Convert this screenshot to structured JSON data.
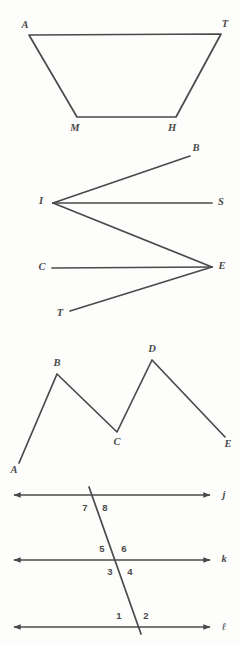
{
  "page": {
    "background_color": "#fdfdfc",
    "ink_color": "#4a4a4a",
    "width": 241,
    "height": 645
  },
  "figures": [
    {
      "id": "figure-1",
      "name": "trapezoid-ATHM",
      "type": "polygon",
      "description": "Closed quadrilateral (trapezoid) with vertices A, T, H, M",
      "vertices": [
        {
          "label": "A",
          "x": 29,
          "y": 35,
          "label_x": 25,
          "label_y": 26
        },
        {
          "label": "T",
          "x": 221,
          "y": 34,
          "label_x": 225,
          "label_y": 25
        },
        {
          "label": "H",
          "x": 176,
          "y": 117,
          "label_x": 172,
          "label_y": 129
        },
        {
          "label": "M",
          "x": 77,
          "y": 117,
          "label_x": 75,
          "label_y": 129
        }
      ],
      "closed": true
    },
    {
      "id": "figure-2",
      "name": "zigzag-BISCET",
      "type": "rays-and-segments",
      "description": "Zigzag: ray IB, ray IS, segment I to E, ray EC, ray ET",
      "points": [
        {
          "label": "B",
          "x": 190,
          "y": 156,
          "label_x": 196,
          "label_y": 149
        },
        {
          "label": "I",
          "x": 53,
          "y": 203,
          "label_x": 41,
          "label_y": 202
        },
        {
          "label": "S",
          "x": 212,
          "y": 203,
          "label_x": 221,
          "label_y": 203
        },
        {
          "label": "C",
          "x": 52,
          "y": 268,
          "label_x": 42,
          "label_y": 268
        },
        {
          "label": "E",
          "x": 212,
          "y": 267,
          "label_x": 222,
          "label_y": 267
        },
        {
          "label": "T",
          "x": 70,
          "y": 311,
          "label_x": 60,
          "label_y": 314
        }
      ],
      "paths": [
        [
          "B",
          "I"
        ],
        [
          "I",
          "S"
        ],
        [
          "I",
          "E"
        ],
        [
          "C",
          "E"
        ],
        [
          "E",
          "T"
        ]
      ]
    },
    {
      "id": "figure-3",
      "name": "polyline-ABCDE",
      "type": "polyline",
      "description": "Open W-shaped polyline through A, B, C, D, E",
      "vertices": [
        {
          "label": "A",
          "x": 19,
          "y": 463,
          "label_x": 14,
          "label_y": 471
        },
        {
          "label": "B",
          "x": 57,
          "y": 374,
          "label_x": 57,
          "label_y": 364
        },
        {
          "label": "C",
          "x": 117,
          "y": 432,
          "label_x": 117,
          "label_y": 443
        },
        {
          "label": "D",
          "x": 152,
          "y": 360,
          "label_x": 152,
          "label_y": 350
        },
        {
          "label": "E",
          "x": 225,
          "y": 437,
          "label_x": 228,
          "label_y": 445
        }
      ],
      "closed": false
    },
    {
      "id": "figure-4",
      "name": "parallel-lines-transversal",
      "type": "parallel-lines",
      "description": "Three parallel lines j, k and script-l cut by one transversal forming eight numbered angles",
      "lines": [
        {
          "label": "j",
          "y": 495,
          "x1": 12,
          "x2": 212,
          "label_x": 224,
          "label_y": 496
        },
        {
          "label": "k",
          "y": 560,
          "x1": 12,
          "x2": 212,
          "label_x": 224,
          "label_y": 560
        },
        {
          "label": "ℓ",
          "y": 627,
          "x1": 12,
          "x2": 212,
          "label_x": 224,
          "label_y": 628
        }
      ],
      "transversal": {
        "x1": 89,
        "y1": 487,
        "x2": 141,
        "y2": 634
      },
      "angles": [
        {
          "number": "1",
          "x": 119,
          "y": 616
        },
        {
          "number": "2",
          "x": 146,
          "y": 616
        },
        {
          "number": "3",
          "x": 110,
          "y": 572
        },
        {
          "number": "4",
          "x": 130,
          "y": 572
        },
        {
          "number": "5",
          "x": 102,
          "y": 549
        },
        {
          "number": "6",
          "x": 124,
          "y": 549
        },
        {
          "number": "7",
          "x": 85,
          "y": 508
        },
        {
          "number": "8",
          "x": 105,
          "y": 508
        }
      ]
    }
  ]
}
